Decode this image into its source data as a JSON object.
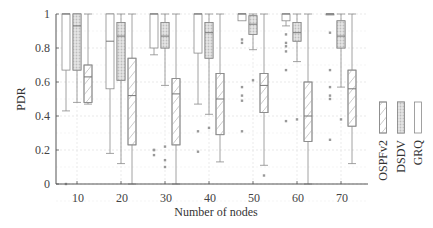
{
  "chart_data": {
    "type": "box",
    "title": "",
    "xlabel": "Number of nodes",
    "ylabel": "PDR",
    "ylim": [
      0,
      1
    ],
    "yticks": [
      0,
      0.2,
      0.4,
      0.6,
      0.8,
      1
    ],
    "ytick_labels": [
      "0",
      "0.2",
      "0.4",
      "0.6",
      "0.8",
      "1"
    ],
    "categories": [
      "10",
      "20",
      "30",
      "40",
      "50",
      "60",
      "70"
    ],
    "grid": true,
    "legend": {
      "position": "right",
      "entries": [
        "OSPFv2",
        "DSDV",
        "GRQ"
      ]
    },
    "series": [
      {
        "name": "GRQ",
        "pattern": "plain",
        "boxes": [
          {
            "min": 0.43,
            "q1": 0.67,
            "median": 1.0,
            "q3": 1.0,
            "max": 1.0,
            "outliers": [
              0
            ]
          },
          {
            "min": 0.18,
            "q1": 0.56,
            "median": 0.84,
            "q3": 1.0,
            "max": 1.0,
            "outliers": []
          },
          {
            "min": 0.76,
            "q1": 0.8,
            "median": 1.0,
            "q3": 1.0,
            "max": 1.0,
            "outliers": [
              0.2,
              0.2,
              0.17
            ]
          },
          {
            "min": 0.47,
            "q1": 0.77,
            "median": 1.0,
            "q3": 1.0,
            "max": 1.0,
            "outliers": [
              0.31,
              0.19
            ]
          },
          {
            "min": 1.0,
            "q1": 0.96,
            "median": 1.0,
            "q3": 1.0,
            "max": 1.0,
            "outliers": [
              0.85,
              0.83,
              0.57,
              0.52,
              0.49,
              0.31
            ]
          },
          {
            "min": 0.93,
            "q1": 0.96,
            "median": 1.0,
            "q3": 1.0,
            "max": 1.0,
            "outliers": [
              0.88,
              0.83,
              0.81,
              0.78,
              0.67,
              0.37
            ]
          },
          {
            "min": 1.0,
            "q1": 1.0,
            "median": 1.0,
            "q3": 1.0,
            "max": 1.0,
            "outliers": [
              0.89,
              0.67,
              0.57,
              0.52,
              0.5,
              0.26
            ]
          }
        ]
      },
      {
        "name": "DSDV",
        "pattern": "dotted",
        "boxes": [
          {
            "min": 0.48,
            "q1": 0.67,
            "median": 0.93,
            "q3": 1.0,
            "max": 1.0,
            "outliers": []
          },
          {
            "min": 0.12,
            "q1": 0.61,
            "median": 0.87,
            "q3": 0.95,
            "max": 1.0,
            "outliers": []
          },
          {
            "min": 0.58,
            "q1": 0.8,
            "median": 0.87,
            "q3": 0.95,
            "max": 1.0,
            "outliers": [
              0.22,
              0.14,
              0.1
            ]
          },
          {
            "min": 0.41,
            "q1": 0.74,
            "median": 0.89,
            "q3": 0.95,
            "max": 1.0,
            "outliers": [
              0.33
            ]
          },
          {
            "min": 0.79,
            "q1": 0.88,
            "median": 0.94,
            "q3": 0.99,
            "max": 1.0,
            "outliers": [
              0.61
            ]
          },
          {
            "min": 0.72,
            "q1": 0.84,
            "median": 0.89,
            "q3": 0.95,
            "max": 1.0,
            "outliers": [
              0.38
            ]
          },
          {
            "min": 0.57,
            "q1": 0.8,
            "median": 0.87,
            "q3": 0.96,
            "max": 1.0,
            "outliers": [
              0.38
            ]
          }
        ]
      },
      {
        "name": "OSPFv2",
        "pattern": "hatched",
        "boxes": [
          {
            "min": 0.47,
            "q1": 0.48,
            "median": 0.63,
            "q3": 0.7,
            "max": 1.0,
            "outliers": []
          },
          {
            "min": 0.0,
            "q1": 0.23,
            "median": 0.52,
            "q3": 0.74,
            "max": 1.0,
            "outliers": []
          },
          {
            "min": 0.0,
            "q1": 0.23,
            "median": 0.53,
            "q3": 0.62,
            "max": 1.0,
            "outliers": []
          },
          {
            "min": 0.13,
            "q1": 0.29,
            "median": 0.5,
            "q3": 0.65,
            "max": 1.0,
            "outliers": []
          },
          {
            "min": 0.11,
            "q1": 0.42,
            "median": 0.58,
            "q3": 0.65,
            "max": 1.0,
            "outliers": [
              0.05
            ]
          },
          {
            "min": 0.0,
            "q1": 0.25,
            "median": 0.4,
            "q3": 0.6,
            "max": 1.0,
            "outliers": []
          },
          {
            "min": 0.12,
            "q1": 0.34,
            "median": 0.56,
            "q3": 0.67,
            "max": 1.0,
            "outliers": []
          }
        ]
      }
    ]
  },
  "axes": {
    "xlabel": "Number of nodes",
    "ylabel": "PDR"
  },
  "legend": {
    "items": [
      {
        "label": "OSPFv2",
        "pattern": "hatched"
      },
      {
        "label": "DSDV",
        "pattern": "dotted"
      },
      {
        "label": "GRQ",
        "pattern": "plain"
      }
    ]
  }
}
